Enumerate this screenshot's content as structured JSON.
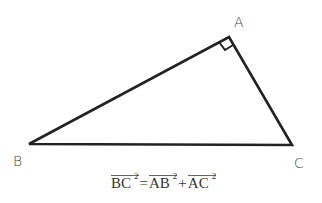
{
  "diagram": {
    "vertices": [
      {
        "name": "A",
        "label": "A",
        "x": 229,
        "y": 37
      },
      {
        "name": "B",
        "label": "B",
        "x": 29,
        "y": 144
      },
      {
        "name": "C",
        "label": "C",
        "x": 292,
        "y": 145
      }
    ],
    "right_angle_at": "A",
    "stroke_color": "#222222",
    "formula": {
      "lhs": {
        "segment": "BC",
        "exponent": "2"
      },
      "equals": "=",
      "rhs": [
        {
          "segment": "AB",
          "exponent": "2"
        },
        {
          "segment": "AC",
          "exponent": "2"
        }
      ],
      "plus": "+"
    }
  }
}
